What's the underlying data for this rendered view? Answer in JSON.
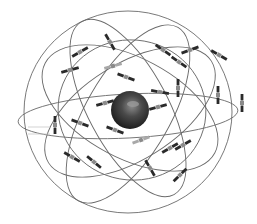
{
  "diagram": {
    "background": "#ffffff",
    "earth": {
      "cx": 130,
      "cy": 110,
      "r": 19,
      "color": "#3a3a3a",
      "highlight": "#8c8c8c"
    },
    "orbits": [
      {
        "cx": 128,
        "cy": 112,
        "rx": 104,
        "ry": 101,
        "rot": 0
      },
      {
        "cx": 128,
        "cy": 116,
        "rx": 110,
        "ry": 22,
        "rot": -3
      },
      {
        "cx": 130,
        "cy": 108,
        "rx": 96,
        "ry": 50,
        "rot": 28
      },
      {
        "cx": 130,
        "cy": 112,
        "rx": 96,
        "ry": 48,
        "rot": -32
      },
      {
        "cx": 128,
        "cy": 108,
        "rx": 98,
        "ry": 40,
        "rot": 62
      },
      {
        "cx": 128,
        "cy": 114,
        "rx": 100,
        "ry": 42,
        "rot": -60
      },
      {
        "cx": 132,
        "cy": 110,
        "rx": 74,
        "ry": 70,
        "rot": 10
      }
    ],
    "satellites": [
      {
        "x": 80,
        "y": 52,
        "rot": -30,
        "tone": "dark"
      },
      {
        "x": 110,
        "y": 42,
        "rot": 60,
        "tone": "dark"
      },
      {
        "x": 70,
        "y": 70,
        "rot": -15,
        "tone": "dark"
      },
      {
        "x": 113,
        "y": 66,
        "rot": -15,
        "tone": "light"
      },
      {
        "x": 126,
        "y": 77,
        "rot": 20,
        "tone": "dark"
      },
      {
        "x": 163,
        "y": 50,
        "rot": 35,
        "tone": "dark"
      },
      {
        "x": 190,
        "y": 50,
        "rot": -20,
        "tone": "dark"
      },
      {
        "x": 219,
        "y": 55,
        "rot": 30,
        "tone": "dark"
      },
      {
        "x": 179,
        "y": 62,
        "rot": 35,
        "tone": "dark"
      },
      {
        "x": 178,
        "y": 88,
        "rot": 90,
        "tone": "dark"
      },
      {
        "x": 160,
        "y": 92,
        "rot": 10,
        "tone": "dark"
      },
      {
        "x": 218,
        "y": 95,
        "rot": 90,
        "tone": "dark"
      },
      {
        "x": 242,
        "y": 103,
        "rot": 90,
        "tone": "dark"
      },
      {
        "x": 105,
        "y": 103,
        "rot": -15,
        "tone": "dark"
      },
      {
        "x": 158,
        "y": 107,
        "rot": -15,
        "tone": "dark"
      },
      {
        "x": 80,
        "y": 123,
        "rot": 20,
        "tone": "dark"
      },
      {
        "x": 115,
        "y": 130,
        "rot": 20,
        "tone": "dark"
      },
      {
        "x": 141,
        "y": 140,
        "rot": -20,
        "tone": "light"
      },
      {
        "x": 72,
        "y": 157,
        "rot": 30,
        "tone": "dark"
      },
      {
        "x": 94,
        "y": 162,
        "rot": 40,
        "tone": "dark"
      },
      {
        "x": 170,
        "y": 148,
        "rot": -30,
        "tone": "dark"
      },
      {
        "x": 183,
        "y": 145,
        "rot": -30,
        "tone": "dark"
      },
      {
        "x": 150,
        "y": 168,
        "rot": 60,
        "tone": "dark"
      },
      {
        "x": 180,
        "y": 175,
        "rot": -45,
        "tone": "dark"
      },
      {
        "x": 55,
        "y": 125,
        "rot": 90,
        "tone": "dark"
      }
    ],
    "labels": [
      {
        "x": 28,
        "y": 127,
        "text": ""
      },
      {
        "x": 28,
        "y": 134,
        "text": ""
      }
    ]
  }
}
